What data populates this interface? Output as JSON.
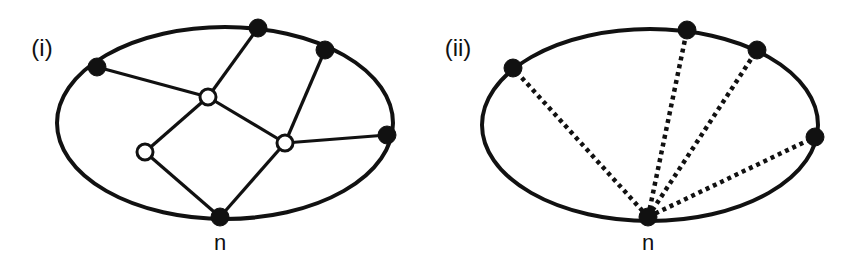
{
  "panels": [
    {
      "id": "i",
      "label": "(i)",
      "label_pos": [
        42,
        56
      ],
      "ellipse": {
        "cx": 225,
        "cy": 123,
        "rx": 168,
        "ry": 96
      },
      "nodes": [
        {
          "id": "a",
          "x": 97,
          "y": 67,
          "type": "filled"
        },
        {
          "id": "b",
          "x": 258,
          "y": 28,
          "type": "filled"
        },
        {
          "id": "c",
          "x": 325,
          "y": 50,
          "type": "filled"
        },
        {
          "id": "d",
          "x": 387,
          "y": 135,
          "type": "filled"
        },
        {
          "id": "n",
          "x": 220,
          "y": 217,
          "type": "filled"
        },
        {
          "id": "u",
          "x": 208,
          "y": 97,
          "type": "open"
        },
        {
          "id": "v",
          "x": 145,
          "y": 152,
          "type": "open"
        },
        {
          "id": "w",
          "x": 285,
          "y": 143,
          "type": "open"
        }
      ],
      "edges": [
        {
          "from": "a",
          "to": "u",
          "style": "solid"
        },
        {
          "from": "b",
          "to": "u",
          "style": "solid"
        },
        {
          "from": "u",
          "to": "v",
          "style": "solid"
        },
        {
          "from": "u",
          "to": "w",
          "style": "solid"
        },
        {
          "from": "c",
          "to": "w",
          "style": "solid"
        },
        {
          "from": "w",
          "to": "d",
          "style": "solid"
        },
        {
          "from": "v",
          "to": "n",
          "style": "solid"
        },
        {
          "from": "w",
          "to": "n",
          "style": "solid"
        }
      ],
      "n_label": "n",
      "n_label_pos": [
        220,
        250
      ]
    },
    {
      "id": "ii",
      "label": "(ii)",
      "label_pos": [
        458,
        56
      ],
      "ellipse": {
        "cx": 650,
        "cy": 125,
        "rx": 168,
        "ry": 96
      },
      "nodes": [
        {
          "id": "a",
          "x": 513,
          "y": 68,
          "type": "filled"
        },
        {
          "id": "b",
          "x": 687,
          "y": 30,
          "type": "filled"
        },
        {
          "id": "c",
          "x": 757,
          "y": 50,
          "type": "filled"
        },
        {
          "id": "d",
          "x": 815,
          "y": 137,
          "type": "filled"
        },
        {
          "id": "n",
          "x": 648,
          "y": 217,
          "type": "filled"
        }
      ],
      "edges": [
        {
          "from": "n",
          "to": "a",
          "style": "dotted"
        },
        {
          "from": "n",
          "to": "b",
          "style": "dotted"
        },
        {
          "from": "n",
          "to": "c",
          "style": "dotted"
        },
        {
          "from": "n",
          "to": "d",
          "style": "dotted"
        }
      ],
      "n_label": "n",
      "n_label_pos": [
        648,
        250
      ]
    }
  ],
  "colors": {
    "stroke": "#111111",
    "fill_filled": "#111111",
    "fill_open": "#ffffff",
    "background": "#ffffff"
  }
}
